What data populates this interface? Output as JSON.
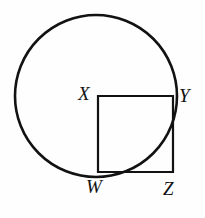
{
  "figure": {
    "background_color": "#fefefe",
    "stroke_color": "#121212",
    "canvas": {
      "width": 205,
      "height": 218
    },
    "circle": {
      "name": "circle",
      "center_x": 96,
      "center_y": 96,
      "radius": 81,
      "stroke_width": 2.6
    },
    "square": {
      "name": "square-WXYZ",
      "left": 98,
      "top": 96,
      "right": 173,
      "bottom": 172,
      "stroke_width": 2.2
    },
    "labels": {
      "x": "X",
      "y": "Y",
      "w": "W",
      "z": "Z"
    }
  },
  "chart_data": {
    "type": "diagram",
    "points": [
      {
        "label": "X",
        "x": 98,
        "y": 96,
        "role": "circle-center / square-top-left"
      },
      {
        "label": "Y",
        "x": 173,
        "y": 96,
        "role": "square-top-right / on-circle"
      },
      {
        "label": "W",
        "x": 98,
        "y": 172,
        "role": "square-bottom-left / on-circle"
      },
      {
        "label": "Z",
        "x": 173,
        "y": 172,
        "role": "square-bottom-right / outside-circle"
      }
    ],
    "shapes": [
      {
        "type": "circle",
        "center": [
          96,
          96
        ],
        "radius": 81
      },
      {
        "type": "square",
        "vertices": [
          [
            98,
            96
          ],
          [
            173,
            96
          ],
          [
            173,
            172
          ],
          [
            98,
            172
          ]
        ],
        "side": 76
      }
    ],
    "xlabel": "",
    "ylabel": "",
    "grid": false,
    "legend": false
  }
}
